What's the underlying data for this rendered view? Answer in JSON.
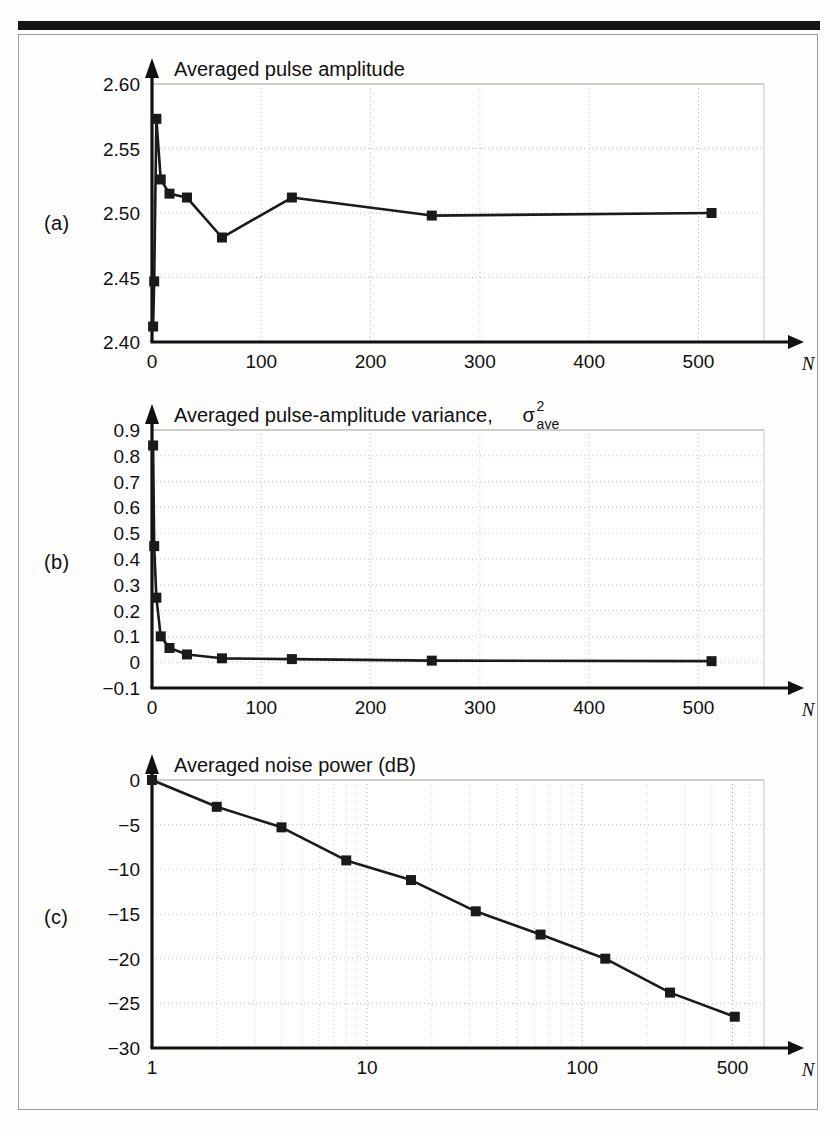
{
  "figure": {
    "panels": [
      {
        "label": "(a)"
      },
      {
        "label": "(b)"
      },
      {
        "label": "(c)"
      }
    ]
  },
  "chart_data": [
    {
      "id": "a",
      "type": "line",
      "title": "Averaged pulse amplitude",
      "xlabel": "N",
      "ylabel": "",
      "xscale": "linear",
      "yscale": "linear",
      "xlim": [
        0,
        560
      ],
      "ylim": [
        2.4,
        2.6
      ],
      "xticks": [
        0,
        100,
        200,
        300,
        400,
        500
      ],
      "xticklabels": [
        "0",
        "100",
        "200",
        "300",
        "400",
        "500"
      ],
      "yticks": [
        2.4,
        2.45,
        2.5,
        2.55,
        2.6
      ],
      "yticklabels": [
        "2.40",
        "2.45",
        "2.50",
        "2.55",
        "2.60"
      ],
      "grid": true,
      "marker": "square",
      "x": [
        1,
        2,
        4,
        8,
        16,
        32,
        64,
        128,
        256,
        512
      ],
      "values": [
        2.412,
        2.447,
        2.573,
        2.526,
        2.515,
        2.512,
        2.481,
        2.512,
        2.498,
        2.5
      ]
    },
    {
      "id": "b",
      "type": "line",
      "title": "Averaged pulse-amplitude variance,",
      "title_symbol": "σ",
      "title_symbol_sup": "2",
      "title_symbol_sub": "ave",
      "xlabel": "N",
      "ylabel": "",
      "xscale": "linear",
      "yscale": "linear",
      "xlim": [
        0,
        560
      ],
      "ylim": [
        -0.1,
        0.9
      ],
      "xticks": [
        0,
        100,
        200,
        300,
        400,
        500
      ],
      "xticklabels": [
        "0",
        "100",
        "200",
        "300",
        "400",
        "500"
      ],
      "yticks": [
        -0.1,
        0,
        0.1,
        0.2,
        0.3,
        0.4,
        0.5,
        0.6,
        0.7,
        0.8,
        0.9
      ],
      "yticklabels": [
        "-0.1",
        "0",
        "0.1",
        "0.2",
        "0.3",
        "0.4",
        "0.5",
        "0.6",
        "0.7",
        "0.8",
        "0.9"
      ],
      "grid": true,
      "marker": "square",
      "x": [
        1,
        2,
        4,
        8,
        16,
        32,
        64,
        128,
        256,
        512
      ],
      "values": [
        0.84,
        0.45,
        0.25,
        0.1,
        0.055,
        0.03,
        0.015,
        0.012,
        0.006,
        0.004
      ]
    },
    {
      "id": "c",
      "type": "line",
      "title": "Averaged noise power (dB)",
      "xlabel": "N",
      "ylabel": "",
      "xscale": "log",
      "yscale": "linear",
      "xlim": [
        1,
        700
      ],
      "ylim": [
        -30,
        0
      ],
      "xticks": [
        1,
        10,
        100,
        500
      ],
      "xticklabels": [
        "1",
        "10",
        "100",
        "500"
      ],
      "yticks": [
        -30,
        -25,
        -20,
        -15,
        -10,
        -5,
        0
      ],
      "yticklabels": [
        "-30",
        "-25",
        "-20",
        "-15",
        "-10",
        "-5",
        "0"
      ],
      "grid": true,
      "marker": "square",
      "x": [
        1,
        2,
        4,
        8,
        16,
        32,
        64,
        128,
        256,
        512
      ],
      "values": [
        0,
        -3.0,
        -5.3,
        -9.0,
        -11.2,
        -14.7,
        -17.3,
        -20.0,
        -23.8,
        -26.5
      ]
    }
  ]
}
